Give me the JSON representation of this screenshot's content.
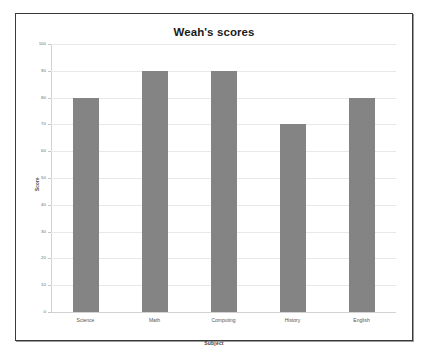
{
  "chart_data": {
    "type": "bar",
    "title": "Weah's scores",
    "xlabel": "Subject",
    "ylabel": "Score",
    "categories": [
      "Science",
      "Math",
      "Computing",
      "History",
      "English"
    ],
    "values": [
      80,
      90,
      90,
      70,
      80
    ],
    "ylim": [
      0,
      100
    ],
    "ytick_step": 10,
    "yticks": [
      100,
      90,
      80,
      70,
      60,
      50,
      40,
      30,
      20,
      10,
      0
    ],
    "grid": true,
    "legend": "none",
    "series": [
      {
        "name": "Score",
        "values": [
          80,
          90,
          90,
          70,
          80
        ]
      }
    ],
    "colors": {
      "bar": "#848484",
      "gridline": "#e8e8e8",
      "axis": "#d2d2d2",
      "frame_border": "#3a3a3a",
      "background": "#ffffff",
      "title_text": "#1b1b1b",
      "tick_text": "#6d6d6d"
    }
  }
}
